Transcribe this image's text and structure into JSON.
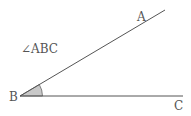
{
  "diagram": {
    "title_label": "∠ABC",
    "points": {
      "A": {
        "label": "A",
        "x": 165,
        "y": 10
      },
      "B": {
        "label": "B",
        "x": 20,
        "y": 96
      },
      "C": {
        "label": "C",
        "x": 183,
        "y": 96
      }
    },
    "angle_fill": "#c8c8c8",
    "line_color": "#555555"
  }
}
